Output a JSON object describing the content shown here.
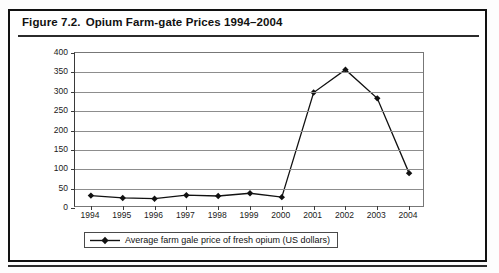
{
  "figure": {
    "number": "Figure 7.2.",
    "title": "Opium Farm-gate Prices 1994–2004"
  },
  "chart_data": {
    "type": "line",
    "title": "Opium Farm-gate Prices 1994–2004",
    "xlabel": "",
    "ylabel": "",
    "categories": [
      "1994",
      "1995",
      "1996",
      "1997",
      "1998",
      "1999",
      "2000",
      "2001",
      "2002",
      "2003",
      "2004"
    ],
    "values": [
      32,
      26,
      24,
      33,
      31,
      38,
      28,
      298,
      357,
      283,
      90
    ],
    "series": [
      {
        "name": "Average farm gale price of fresh opium (US dollars)",
        "values": [
          32,
          26,
          24,
          33,
          31,
          38,
          28,
          298,
          357,
          283,
          90
        ]
      }
    ],
    "ylim": [
      0,
      400
    ],
    "yticks": [
      0,
      50,
      100,
      150,
      200,
      250,
      300,
      350,
      400
    ],
    "ytick_labels": [
      "0",
      "50",
      "100",
      "150",
      "200",
      "250",
      "300",
      "350",
      "400"
    ],
    "grid": true,
    "legend_position": "bottom",
    "marker": "diamond",
    "line_color": "#111111",
    "marker_color": "#111111"
  },
  "legend": {
    "label": "Average farm gale price of fresh opium (US dollars)"
  }
}
